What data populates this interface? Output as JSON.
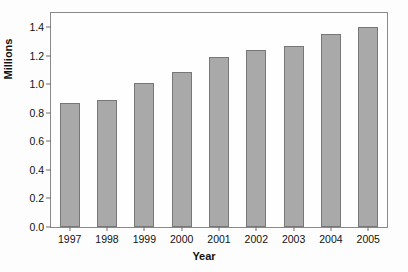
{
  "chart_data": {
    "type": "bar",
    "title": "",
    "subtitle": "",
    "xlabel": "Year",
    "ylabel": "Millions",
    "categories": [
      "1997",
      "1998",
      "1999",
      "2000",
      "2001",
      "2002",
      "2003",
      "2004",
      "2005"
    ],
    "values": [
      0.87,
      0.89,
      1.01,
      1.09,
      1.19,
      1.24,
      1.27,
      1.35,
      1.4
    ],
    "ylim": [
      0.0,
      1.5
    ],
    "ytick_labels": [
      "0.0",
      "0.2",
      "0.4",
      "0.6",
      "0.8",
      "1.0",
      "1.2",
      "1.4"
    ],
    "ytick_values": [
      0.0,
      0.2,
      0.4,
      0.6,
      0.8,
      1.0,
      1.2,
      1.4
    ],
    "grid": false,
    "legend": "none",
    "bar_color": "#a9a9a9",
    "bar_edge_color": "#777777",
    "frame_color": "#8a8a8a",
    "text_color": "#111111",
    "background": "#fdfdfd"
  }
}
